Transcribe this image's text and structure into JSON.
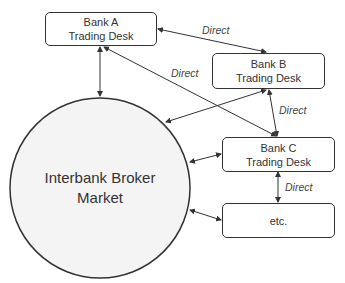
{
  "diagram": {
    "nodes": {
      "bank_a": {
        "line1": "Bank A",
        "line2": "Trading Desk"
      },
      "bank_b": {
        "line1": "Bank B",
        "line2": "Trading Desk"
      },
      "bank_c": {
        "line1": "Bank C",
        "line2": "Trading Desk"
      },
      "etc": {
        "line1": "etc."
      },
      "market": {
        "line1": "Interbank Broker",
        "line2": "Market"
      }
    },
    "edge_labels": {
      "a_b": "Direct",
      "a_c": "Direct",
      "b_c": "Direct",
      "c_etc": "Direct"
    }
  }
}
